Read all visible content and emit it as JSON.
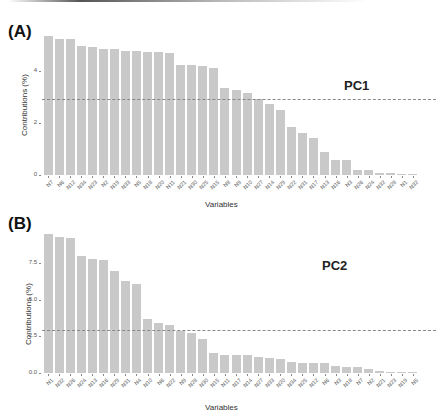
{
  "chart_data": [
    {
      "type": "bar",
      "panel": "(A)",
      "title": "PC1",
      "xlabel": "Variables",
      "ylabel": "Contributions (%)",
      "ylim": [
        0,
        5.6
      ],
      "yticks": [
        "0",
        "2",
        "4"
      ],
      "yticks_values": [
        0,
        2,
        4
      ],
      "reference_line": 2.94,
      "reference_line_style": "dashed",
      "categories": [
        "N7",
        "N6",
        "N12",
        "N34",
        "N23",
        "N2",
        "N19",
        "N33",
        "N5",
        "N18",
        "N20",
        "N11",
        "N21",
        "N30",
        "N25",
        "N15",
        "N8",
        "N9",
        "N10",
        "N27",
        "N14",
        "N29",
        "N22",
        "N31",
        "N17",
        "N13",
        "N16",
        "N3",
        "N26",
        "N24",
        "N32",
        "N28",
        "N1",
        "N32",
        "N4"
      ],
      "values": [
        5.35,
        5.23,
        5.23,
        4.96,
        4.92,
        4.85,
        4.85,
        4.77,
        4.77,
        4.73,
        4.73,
        4.69,
        4.23,
        4.23,
        4.19,
        4.12,
        3.35,
        3.27,
        3.15,
        2.92,
        2.73,
        2.5,
        1.85,
        1.62,
        1.42,
        0.88,
        0.58,
        0.58,
        0.19,
        0.19,
        0.08,
        0.08,
        0.05,
        0.03
      ]
    },
    {
      "type": "bar",
      "panel": "(B)",
      "title": "PC2",
      "xlabel": "Variables",
      "ylabel": "Contributions (%)",
      "ylim": [
        0,
        9.8
      ],
      "yticks": [
        "0.0",
        "2.5",
        "5.0",
        "7.5"
      ],
      "yticks_values": [
        0,
        2.5,
        5.0,
        7.5
      ],
      "reference_line": 2.94,
      "reference_line_style": "dashed",
      "categories": [
        "N1",
        "N32",
        "N26",
        "N24",
        "N13",
        "N16",
        "N29",
        "N31",
        "N4",
        "N10",
        "N6",
        "N22",
        "N9",
        "N28",
        "N30",
        "N15",
        "N11",
        "N17",
        "N14",
        "N27",
        "N33",
        "N20",
        "N34",
        "N25",
        "N12",
        "N6",
        "N3",
        "N18",
        "N7",
        "N2",
        "N21",
        "N23",
        "N19",
        "N5"
      ],
      "values": [
        9.45,
        9.25,
        9.18,
        7.96,
        7.76,
        7.69,
        6.94,
        6.26,
        6.05,
        3.67,
        3.4,
        3.27,
        2.86,
        2.72,
        2.31,
        1.36,
        1.22,
        1.22,
        1.22,
        1.1,
        1.0,
        0.95,
        0.75,
        0.7,
        0.68,
        0.66,
        0.5,
        0.4,
        0.4,
        0.27,
        0.12,
        0.1,
        0.05,
        0.04
      ]
    }
  ],
  "colors": {
    "bar": "#c9c9c9",
    "reference_line": "#888888",
    "text": "#333333"
  }
}
